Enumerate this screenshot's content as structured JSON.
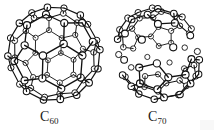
{
  "figure": {
    "background_color": "#ffffff",
    "line_color": "#111111",
    "atom_fill_color": "#ffffff",
    "width": 217,
    "height": 132
  },
  "molecules": [
    {
      "id": "c60",
      "name": "C60",
      "label_text": "C",
      "label_subscript": "60",
      "atom_count": 60,
      "geometry": "truncated icosahedron",
      "shape": "spherical",
      "faces": "12 pentagons, 20 hexagons",
      "projection": {
        "cx": 48,
        "cy": 50,
        "rx": 45,
        "ry": 46
      }
    },
    {
      "id": "c70",
      "name": "C70",
      "label_text": "C",
      "label_subscript": "70",
      "atom_count": 70,
      "geometry": "elongated fullerene",
      "shape": "prolate / rugby ball",
      "faces": "12 pentagons, 25 hexagons",
      "projection": {
        "cx": 52,
        "cy": 51,
        "rx": 50,
        "ry": 48
      }
    }
  ]
}
